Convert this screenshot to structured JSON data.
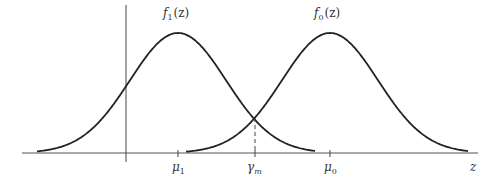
{
  "figure": {
    "type": "two-gaussian-densities",
    "curves": [
      {
        "id": "f1",
        "label": "f",
        "subscript": "1",
        "arg": "(z)",
        "mean_label": "μ",
        "mean_sub": "1",
        "peak_x": 178,
        "sigma_px": 48,
        "x_start": 37,
        "x_end": 315
      },
      {
        "id": "f0",
        "label": "f",
        "subscript": "0",
        "arg": "(z)",
        "mean_label": "μ",
        "mean_sub": "0",
        "peak_x": 330,
        "sigma_px": 48,
        "x_start": 186,
        "x_end": 468
      }
    ],
    "threshold": {
      "label": "γ",
      "subscript": "m",
      "x": 255
    },
    "axis": {
      "x_label": "z"
    },
    "colors": {
      "curve": "#222222",
      "axis": "#444444",
      "text": "#333333"
    }
  }
}
